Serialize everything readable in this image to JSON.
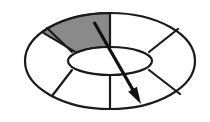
{
  "canvas": {
    "width": 210,
    "height": 122,
    "background_color": "#ffffff",
    "title": "Annulus with highlighted sector and direction arrow"
  },
  "figure": {
    "name": "segmented-annulus",
    "stroke_color": "#1a1a1a",
    "fill_color": "#ffffff",
    "shaded_sector_color": "#8a8a8a",
    "arrow_color": "#111111",
    "outer_ellipse": {
      "name": "outer-rim",
      "cx": 110,
      "cy": 61,
      "rx": 85,
      "ry": 48
    },
    "inner_ellipse": {
      "name": "inner-hub",
      "cx": 110,
      "cy": 61,
      "rx": 42,
      "ry": 14
    },
    "sector_count": 6,
    "spokes": [
      {
        "name": "spoke-top",
        "angle_deg": 90,
        "inner": [
          110,
          47
        ],
        "outer": [
          110,
          13
        ]
      },
      {
        "name": "spoke-upper-left",
        "angle_deg": 143,
        "inner": [
          72,
          52
        ],
        "outer": [
          47,
          28
        ]
      },
      {
        "name": "spoke-lower-left",
        "angle_deg": 217,
        "inner": [
          72,
          70
        ],
        "outer": [
          52,
          96
        ]
      },
      {
        "name": "spoke-bottom",
        "angle_deg": 270,
        "inner": [
          110,
          75
        ],
        "outer": [
          110,
          109
        ]
      },
      {
        "name": "spoke-lower-right",
        "angle_deg": 323,
        "inner": [
          149,
          70
        ],
        "outer": [
          180,
          94
        ]
      },
      {
        "name": "spoke-upper-right",
        "angle_deg": 37,
        "inner": [
          149,
          52
        ],
        "outer": [
          178,
          29
        ]
      }
    ],
    "shaded_sector": {
      "name": "highlighted-sector",
      "between_spokes": [
        "spoke-upper-left",
        "spoke-top"
      ],
      "fill": "#8a8a8a",
      "start_angle_deg": 90,
      "end_angle_deg": 143
    },
    "arrow": {
      "name": "direction-arrow",
      "tail": [
        94,
        22
      ],
      "tip": [
        141,
        104
      ],
      "head_length": 17,
      "head_width": 10,
      "stroke_width": 3.2
    }
  }
}
